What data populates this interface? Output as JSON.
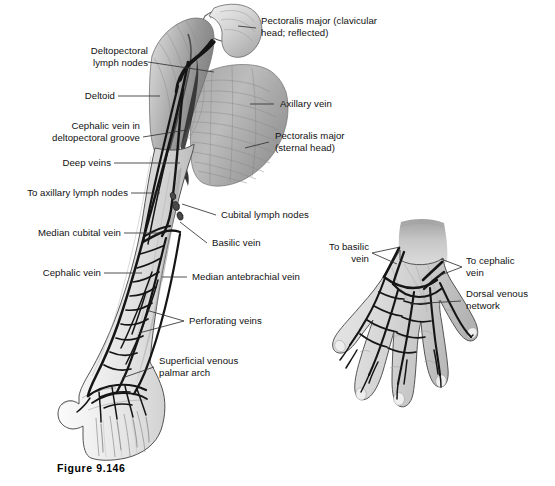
{
  "figure": {
    "caption": "Figure 9.146",
    "background_color": "#ffffff",
    "text_color": "#111111",
    "vein_color": "#1a1a1a",
    "leader_color": "#333333"
  },
  "labels": {
    "deltopectoral_lymph_nodes": "Deltopectoral\nlymph nodes",
    "deltoid": "Deltoid",
    "cephalic_vein_in_groove": "Cephalic vein in\ndeltopectoral groove",
    "deep_veins": "Deep veins",
    "to_axillary_lymph_nodes": "To axillary lymph nodes",
    "median_cubital_vein": "Median cubital vein",
    "cephalic_vein": "Cephalic vein",
    "pectoralis_major_clavicular": "Pectoralis major (clavicular\nhead; reflected)",
    "axillary_vein": "Axillary vein",
    "pectoralis_major_sternal": "Pectoralis major\n(sternal head)",
    "cubital_lymph_nodes": "Cubital lymph nodes",
    "basilic_vein": "Basilic vein",
    "median_antebrachial_vein": "Median antebrachial vein",
    "perforating_veins": "Perforating veins",
    "superficial_venous_palmar_arch": "Superficial venous\npalmar arch",
    "to_basilic_vein": "To basilic\nvein",
    "to_cephalic_vein": "To cephalic\nvein",
    "dorsal_venous_network": "Dorsal venous\nnetwork"
  }
}
